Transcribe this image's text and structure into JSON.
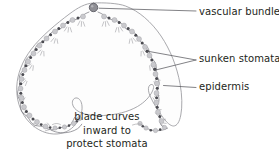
{
  "figure": {
    "background_color": "#ffffff",
    "text_color": "#231f20"
  },
  "labels": {
    "vascular_bundle": "vascular bundle",
    "sunken_stomata": "sunken stomata",
    "epidermis": "epidermis"
  },
  "caption": {
    "line1": "blade curves",
    "line2": "inward to",
    "line3": "protect stomata"
  },
  "diagram": {
    "outline_name": "leaf-blade-outline",
    "outline_stroke": "#9a9a9e",
    "inner_wall_stroke": "#6f6f74",
    "mesophyll_fill": "#fdfdfd",
    "cell_fill": "#c9c9cd",
    "cell_stroke": "#9d9da2",
    "stoma_fill": "#4a4a50",
    "vascular_bundle_fill": "#8e8e94",
    "vascular_bundle_stroke": "#5f5f66",
    "leader_stroke": "#58585e",
    "hair_stroke": "#8a8a90",
    "vascular_bundle_center": {
      "cx": 93.5,
      "cy": 7.5,
      "r": 4.2
    },
    "leaders": [
      {
        "name": "leader-vascular-bundle",
        "x1": 99,
        "y1": 8,
        "x2": 196,
        "y2": 11
      },
      {
        "name": "leader-sunken-stomata-upper",
        "x1": 147,
        "y1": 50,
        "x2": 196,
        "y2": 60
      },
      {
        "name": "leader-sunken-stomata-lower",
        "x1": 152.5,
        "y1": 71,
        "x2": 196,
        "y2": 60
      },
      {
        "name": "leader-epidermis",
        "x1": 163,
        "y1": 86,
        "x2": 196,
        "y2": 87
      }
    ],
    "cell_count": 44,
    "stoma_count": 22
  }
}
